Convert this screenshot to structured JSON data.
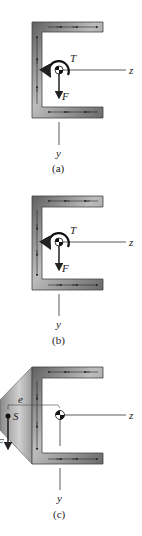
{
  "figure": {
    "panels": [
      {
        "id": "a",
        "caption": "(a)",
        "labels": {
          "torque": "T",
          "force": "F",
          "z_axis": "z",
          "y_axis": "y"
        },
        "flow_direction": "counterclockwise"
      },
      {
        "id": "b",
        "caption": "(b)",
        "labels": {
          "torque": "T",
          "force": "F",
          "z_axis": "z",
          "y_axis": "y"
        },
        "flow_direction": "clockwise"
      },
      {
        "id": "c",
        "caption": "(c)",
        "labels": {
          "shear_center": "S",
          "eccentricity": "e",
          "force": "F",
          "z_axis": "z",
          "y_axis": "y"
        },
        "flow_direction": "clockwise"
      }
    ]
  },
  "colors": {
    "channel_dark": "#5a5a5a",
    "channel_light": "#c8c8c8",
    "line": "#333333"
  }
}
